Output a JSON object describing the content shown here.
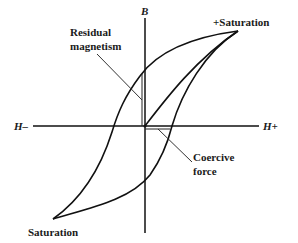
{
  "diagram": {
    "axes": {
      "vertical_label": "B",
      "horizontal_negative_label": "H–",
      "horizontal_positive_label": "H+"
    },
    "labels": {
      "positive_saturation": "+Saturation",
      "negative_saturation": "Saturation",
      "residual_magnetism_line1": "Residual",
      "residual_magnetism_line2": "magnetism",
      "coercive_force_line1": "Coercive",
      "coercive_force_line2": "force"
    },
    "elements": [
      "B-H hysteresis loop",
      "initial magnetization curve",
      "residual magnetism marker",
      "coercive force marker"
    ],
    "colors": {
      "line": "#111111",
      "background": "#ffffff"
    }
  }
}
